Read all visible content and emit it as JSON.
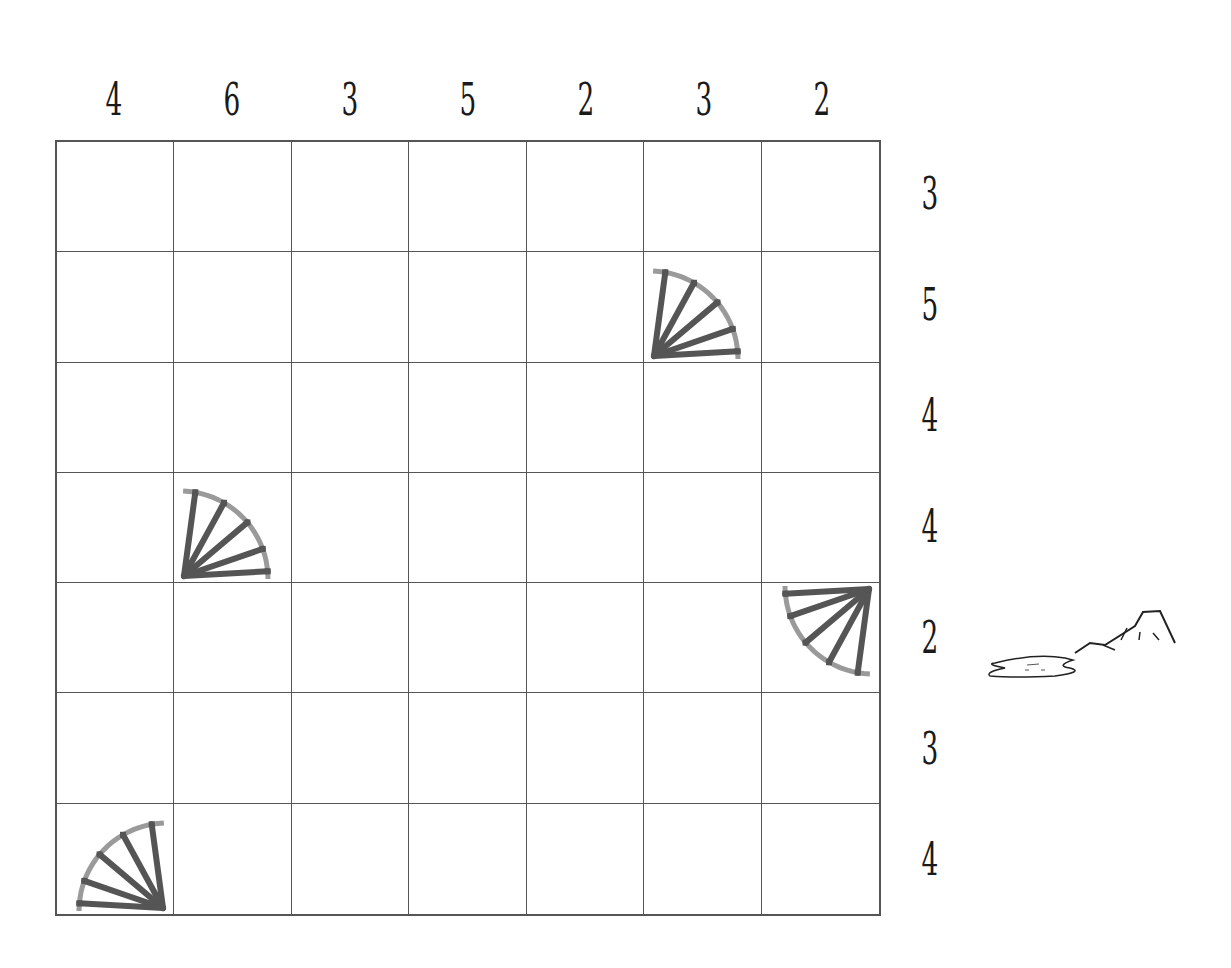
{
  "puzzle": {
    "size": 7,
    "column_clues": [
      "4",
      "6",
      "3",
      "5",
      "2",
      "3",
      "2"
    ],
    "row_clues": [
      "3",
      "5",
      "4",
      "4",
      "2",
      "3",
      "4"
    ],
    "fans": [
      {
        "row": 1,
        "col": 5,
        "corner": "bottom-left"
      },
      {
        "row": 3,
        "col": 1,
        "corner": "bottom-left"
      },
      {
        "row": 4,
        "col": 6,
        "corner": "top-right"
      },
      {
        "row": 6,
        "col": 0,
        "corner": "bottom-right"
      }
    ],
    "colors": {
      "grid_line": "#555555",
      "fan_rib": "#555555",
      "fan_edge": "#9a9a9a",
      "text": "#1a1a1a"
    },
    "decoration": "mountain-lake-icon"
  }
}
